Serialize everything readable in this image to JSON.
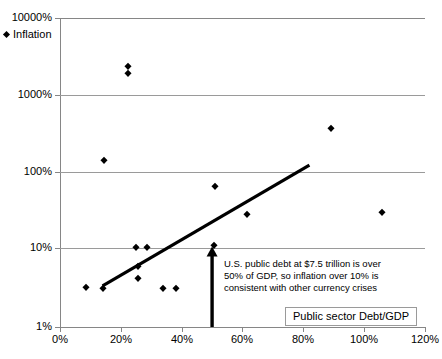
{
  "chart_data": {
    "type": "scatter",
    "title": "",
    "xlabel": "",
    "ylabel": "",
    "xlim": [
      0,
      120
    ],
    "ylim": [
      1,
      10000
    ],
    "yscale": "log",
    "xscale": "linear",
    "grid": "horizontal",
    "legend_position": "top-left",
    "x_ticks": [
      "0%",
      "20%",
      "40%",
      "60%",
      "80%",
      "100%",
      "120%"
    ],
    "x_tick_values": [
      0,
      20,
      40,
      60,
      80,
      100,
      120
    ],
    "y_ticks": [
      "1%",
      "10%",
      "100%",
      "1000%",
      "10000%"
    ],
    "y_tick_values": [
      1,
      10,
      100,
      1000,
      10000
    ],
    "series": [
      {
        "name": "Inflation",
        "marker": "diamond",
        "color": "#000000",
        "points": [
          {
            "x": 8.5,
            "y": 3.3
          },
          {
            "x": 14.5,
            "y": 145
          },
          {
            "x": 14.0,
            "y": 3.2
          },
          {
            "x": 22.5,
            "y": 2400
          },
          {
            "x": 22.5,
            "y": 1950
          },
          {
            "x": 25.0,
            "y": 11
          },
          {
            "x": 25.5,
            "y": 6.2
          },
          {
            "x": 25.5,
            "y": 4.3
          },
          {
            "x": 28.5,
            "y": 11
          },
          {
            "x": 34.0,
            "y": 3.2
          },
          {
            "x": 38.0,
            "y": 3.2
          },
          {
            "x": 50.5,
            "y": 11.5
          },
          {
            "x": 51.0,
            "y": 67
          },
          {
            "x": 61.5,
            "y": 29
          },
          {
            "x": 89.0,
            "y": 380
          },
          {
            "x": 106.0,
            "y": 31
          }
        ]
      }
    ],
    "trendline": {
      "x_start": 14.0,
      "y_start": 3.4,
      "x_end": 82.0,
      "y_end": 125,
      "color": "#000000"
    },
    "annotations": [
      {
        "type": "arrow",
        "x": 50,
        "y_from": 1,
        "y_to": 11,
        "direction": "up",
        "color": "#000000"
      },
      {
        "type": "text",
        "lines": [
          "U.S. public debt at $7.5 trillion is over",
          "50% of GDP, so inflation over 10% is",
          "consistent with other currency crises"
        ]
      }
    ],
    "legend_label": "Inflation",
    "legend_box_label": "Public sector Debt/GDP"
  }
}
